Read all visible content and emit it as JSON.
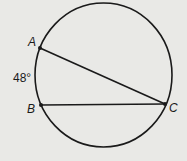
{
  "diagram": {
    "type": "circle-with-chords",
    "points": {
      "A": {
        "label": "A",
        "x": 40,
        "y": 48
      },
      "B": {
        "label": "B",
        "x": 41,
        "y": 105
      },
      "C": {
        "label": "C",
        "x": 165,
        "y": 104
      }
    },
    "chords": [
      "AC",
      "BC"
    ],
    "arc_label": "48°",
    "arc": "AB",
    "colors": {
      "background": "#e9e9e6",
      "stroke": "#1a1a1a"
    }
  }
}
